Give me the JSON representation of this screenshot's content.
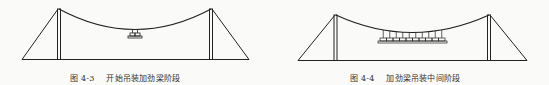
{
  "figures": [
    {
      "number": "图 4-3",
      "title": "开始吊装加劲梁阶段",
      "girder_segments": 2,
      "stage": "start"
    },
    {
      "number": "图 4-4",
      "title": "加劲梁吊装中间阶段",
      "girder_segments": 10,
      "stage": "middle"
    }
  ],
  "colors": {
    "line": "#222222",
    "background": "#fafaf8"
  }
}
